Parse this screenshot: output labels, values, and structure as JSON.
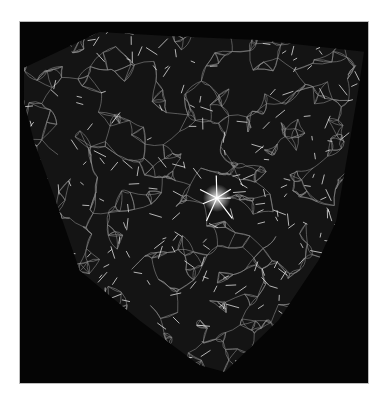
{
  "image": {
    "description": "3D cosmic web simulation cube showing a network of bright filaments on a black background",
    "colors": {
      "page_background": "#ffffff",
      "frame_background": "#050505",
      "frame_border": "#bdbdbd",
      "filament": "#e8e8e8",
      "volume_fill": "#1a1a1a"
    },
    "silhouette_points": "4,46 80,10 150,14 240,18 346,30 340,70 330,130 318,200 300,240 260,300 206,352 180,345 120,300 60,250 36,180 14,120 4,80",
    "bright_node": {
      "x": 198,
      "y": 177
    }
  }
}
